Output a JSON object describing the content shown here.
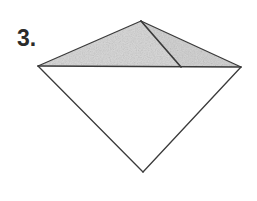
{
  "figure": {
    "label": "3.",
    "label_name": "problem-number-label",
    "canvas": {
      "width": 257,
      "height": 201,
      "background": "#ffffff"
    },
    "style": {
      "stroke_color": "#3a3a3a",
      "stroke_width": 1.3,
      "shaded_fill": "#d8d8d8",
      "unshaded_fill": "#ffffff",
      "texture": "stipple-noise"
    },
    "vertices": [
      {
        "id": "apex-top",
        "name": "A",
        "x": 141,
        "y": 21
      },
      {
        "id": "vertex-left",
        "name": "B",
        "x": 38,
        "y": 66
      },
      {
        "id": "vertex-right",
        "name": "C",
        "x": 241,
        "y": 67
      },
      {
        "id": "apex-bottom",
        "name": "D",
        "x": 143,
        "y": 172
      },
      {
        "id": "point-interior-base",
        "name": "E",
        "x": 181,
        "y": 67
      }
    ],
    "regions": [
      {
        "id": "region-upper-left",
        "label": "upper-left-triangle",
        "points": "141,21 38,66 181,67",
        "shaded": true,
        "fill": "#d9d9d9"
      },
      {
        "id": "region-upper-right",
        "label": "upper-right-triangle",
        "points": "141,21 181,67 241,67",
        "shaded": true,
        "fill": "#d4d4d4"
      },
      {
        "id": "region-lower",
        "label": "lower-triangle",
        "points": "38,66 241,67 143,172",
        "shaded": false,
        "fill": "#ffffff"
      }
    ],
    "edges": [
      {
        "id": "edge-apex-to-left",
        "label": "top-left-edge",
        "x1": 141,
        "y1": 21,
        "x2": 38,
        "y2": 66
      },
      {
        "id": "edge-apex-to-right",
        "label": "top-right-edge",
        "x1": 141,
        "y1": 21,
        "x2": 241,
        "y2": 67
      },
      {
        "id": "edge-left-to-bottom",
        "label": "bottom-left-edge",
        "x1": 38,
        "y1": 66,
        "x2": 143,
        "y2": 172
      },
      {
        "id": "edge-right-to-bottom",
        "label": "bottom-right-edge",
        "x1": 241,
        "y1": 67,
        "x2": 143,
        "y2": 172
      },
      {
        "id": "edge-horizontal-diagonal",
        "label": "horizontal-diagonal",
        "x1": 38,
        "y1": 66,
        "x2": 241,
        "y2": 67
      },
      {
        "id": "edge-interior-segment",
        "label": "interior-segment",
        "x1": 141,
        "y1": 21,
        "x2": 181,
        "y2": 67
      }
    ]
  }
}
